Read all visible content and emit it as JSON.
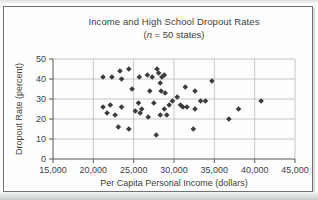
{
  "figure": {
    "title": "Income and High School Dropout Rates",
    "subtitle_open": "(",
    "subtitle_var": "n",
    "subtitle_rest": " = 50 states)",
    "x_axis_title": "Per Capita Personal Income (dollars)",
    "y_axis_title": "Dropout Rate (percent)"
  },
  "colors": {
    "text": "#3c3e40",
    "grid": "#b6b8b9",
    "axis": "#55585a",
    "marker": "#3a3c3e",
    "card_border": "#6f7173"
  },
  "chart_data": {
    "type": "scatter",
    "title": "Income and High School Dropout Rates",
    "subtitle": "(n = 50 states)",
    "xlabel": "Per Capita Personal Income (dollars)",
    "ylabel": "Dropout Rate (percent)",
    "xlim": [
      15000,
      45000
    ],
    "ylim": [
      0,
      50
    ],
    "xticks": [
      15000,
      20000,
      25000,
      30000,
      35000,
      40000,
      45000
    ],
    "xtick_labels": [
      "15,000",
      "20,000",
      "25,000",
      "30,000",
      "35,000",
      "40,000",
      "45,000"
    ],
    "yticks": [
      0,
      10,
      20,
      30,
      40,
      50
    ],
    "ytick_labels": [
      "0",
      "10",
      "20",
      "30",
      "40",
      "50"
    ],
    "grid": true,
    "legend": false,
    "marker": "diamond",
    "n_points": 50,
    "points": [
      [
        21200,
        41
      ],
      [
        22300,
        41
      ],
      [
        23300,
        44
      ],
      [
        24400,
        45
      ],
      [
        23500,
        40
      ],
      [
        25700,
        41
      ],
      [
        26700,
        42
      ],
      [
        27300,
        41
      ],
      [
        27900,
        45
      ],
      [
        28100,
        43
      ],
      [
        28500,
        41
      ],
      [
        28800,
        42
      ],
      [
        24800,
        35
      ],
      [
        28300,
        38
      ],
      [
        27000,
        34
      ],
      [
        28400,
        34
      ],
      [
        28900,
        33
      ],
      [
        31400,
        36
      ],
      [
        34700,
        39
      ],
      [
        32600,
        34
      ],
      [
        29800,
        29
      ],
      [
        30400,
        31
      ],
      [
        29400,
        27
      ],
      [
        28800,
        25
      ],
      [
        27500,
        28
      ],
      [
        26000,
        25
      ],
      [
        23500,
        26
      ],
      [
        22100,
        27
      ],
      [
        21200,
        26
      ],
      [
        30800,
        27
      ],
      [
        31100,
        26
      ],
      [
        31600,
        26
      ],
      [
        32600,
        25
      ],
      [
        33300,
        29
      ],
      [
        33900,
        29
      ],
      [
        38000,
        25
      ],
      [
        40800,
        29
      ],
      [
        21700,
        23
      ],
      [
        22700,
        22
      ],
      [
        25200,
        24
      ],
      [
        25600,
        28
      ],
      [
        25800,
        23
      ],
      [
        26800,
        21
      ],
      [
        28300,
        22
      ],
      [
        29100,
        22
      ],
      [
        23100,
        16
      ],
      [
        24400,
        15
      ],
      [
        32400,
        15
      ],
      [
        36800,
        20
      ],
      [
        27800,
        12
      ]
    ]
  }
}
